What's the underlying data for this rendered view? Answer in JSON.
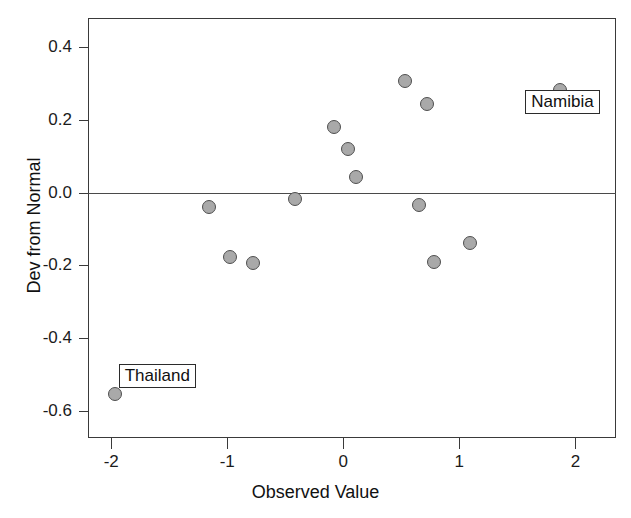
{
  "chart_data": {
    "type": "scatter",
    "title": "",
    "xlabel": "Observed Value",
    "ylabel": "Dev from Normal",
    "xlim": [
      -2.2,
      2.35
    ],
    "ylim": [
      -0.675,
      0.48
    ],
    "xticks": [
      -2,
      -1,
      0,
      1,
      2
    ],
    "xticklabels": [
      "-2",
      "-1",
      "0",
      "1",
      "2"
    ],
    "yticks": [
      0.4,
      0.2,
      0.0,
      -0.2,
      -0.4,
      -0.6
    ],
    "yticklabels": [
      "0.4",
      "0.2",
      "0.0",
      "-0.2",
      "-0.4",
      "-0.6"
    ],
    "grid": false,
    "legend": null,
    "reference_lines": [
      {
        "axis": "y",
        "value": 0.0
      }
    ],
    "marker_fill": "#a9a9a9",
    "marker_edge": "#4f4f4f",
    "points": [
      {
        "x": -1.97,
        "y": -0.553,
        "label": "Thailand"
      },
      {
        "x": -1.16,
        "y": -0.039,
        "label": null
      },
      {
        "x": -0.98,
        "y": -0.178,
        "label": null
      },
      {
        "x": -0.78,
        "y": -0.194,
        "label": null
      },
      {
        "x": -0.42,
        "y": -0.019,
        "label": null
      },
      {
        "x": -0.08,
        "y": 0.181,
        "label": null
      },
      {
        "x": 0.04,
        "y": 0.119,
        "label": null
      },
      {
        "x": 0.11,
        "y": 0.044,
        "label": null
      },
      {
        "x": 0.53,
        "y": 0.306,
        "label": null
      },
      {
        "x": 0.72,
        "y": 0.244,
        "label": null
      },
      {
        "x": 0.65,
        "y": -0.033,
        "label": null
      },
      {
        "x": 0.78,
        "y": -0.192,
        "label": null
      },
      {
        "x": 1.09,
        "y": -0.139,
        "label": null
      },
      {
        "x": 1.87,
        "y": 0.283,
        "label": "Namibia"
      }
    ],
    "annotations": [
      {
        "text": "Thailand",
        "point_x": -1.97,
        "point_y": -0.553
      },
      {
        "text": "Namibia",
        "point_x": 1.87,
        "point_y": 0.283
      }
    ]
  }
}
